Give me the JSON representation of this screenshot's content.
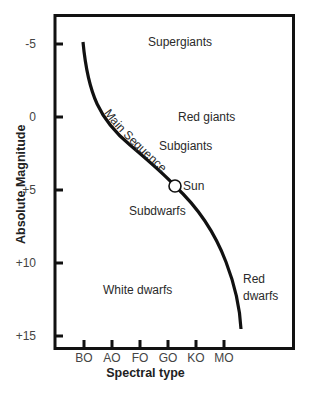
{
  "diagram": {
    "y_axis": {
      "label": "Absolute Magnitude",
      "ticks": [
        "-5",
        "0",
        "+5",
        "+10",
        "+15"
      ]
    },
    "x_axis": {
      "label": "Spectral type",
      "ticks": [
        "BO",
        "AO",
        "FO",
        "GO",
        "KO",
        "MO"
      ]
    },
    "regions": {
      "supergiants": "Supergiants",
      "red_giants": "Red giants",
      "subgiants": "Subgiants",
      "main_sequence": "Main Sequence",
      "sun": "Sun",
      "subdwarfs": "Subdwarfs",
      "white_dwarfs": "White dwarfs",
      "red_dwarfs_line1": "Red",
      "red_dwarfs_line2": "dwarfs"
    },
    "colors": {
      "line": "#111111",
      "text": "#2a2a2a",
      "background": "#ffffff"
    }
  }
}
